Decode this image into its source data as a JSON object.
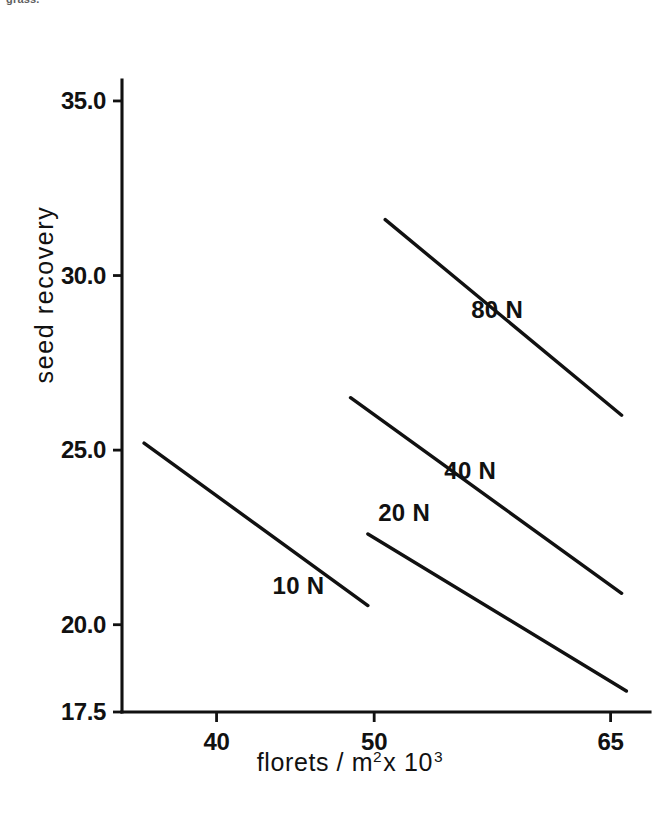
{
  "corner_caption": "grass.",
  "chart_data": {
    "type": "line",
    "title": "",
    "xlabel": "florets / m² x 10³",
    "xlabel_parts": {
      "main": "florets / m",
      "sup1": "2",
      "mid": "x 10",
      "sup2": "3"
    },
    "ylabel": "seed  recovery",
    "grid": false,
    "legend": "inline-annotations",
    "xlim": [
      34.0,
      67.5
    ],
    "ylim": [
      17.5,
      35.6
    ],
    "xticks": [
      40,
      50,
      65
    ],
    "xtick_labels": [
      "40",
      "50",
      "65"
    ],
    "yticks": [
      17.5,
      20.0,
      25.0,
      30.0,
      35.0
    ],
    "ytick_labels": [
      "17.5",
      "20.0",
      "25.0",
      "30.0",
      "35.0"
    ],
    "series": [
      {
        "name": "10 N",
        "label": "10 N",
        "x": [
          35.4,
          49.6
        ],
        "y": [
          25.2,
          20.55
        ]
      },
      {
        "name": "20 N",
        "label": "20 N",
        "x": [
          49.6,
          66.0
        ],
        "y": [
          22.6,
          18.1
        ]
      },
      {
        "name": "40 N",
        "label": "40 N",
        "x": [
          48.5,
          65.7
        ],
        "y": [
          26.5,
          20.9
        ]
      },
      {
        "name": "80 N",
        "label": "80 N",
        "x": [
          50.7,
          65.7
        ],
        "y": [
          31.6,
          26.0
        ]
      }
    ],
    "annotations": [
      {
        "text": "10 N",
        "x": 45.2,
        "y": 21.1
      },
      {
        "text": "20 N",
        "x": 51.9,
        "y": 23.2
      },
      {
        "text": "40 N",
        "x": 56.1,
        "y": 24.4
      },
      {
        "text": "80 N",
        "x": 57.8,
        "y": 29.0
      }
    ],
    "colors": {
      "line": "#111111",
      "axis": "#111111",
      "background": "#ffffff"
    }
  },
  "geometry": {
    "plot_left": 122,
    "plot_right": 650,
    "plot_top": 80,
    "plot_bottom": 712
  }
}
